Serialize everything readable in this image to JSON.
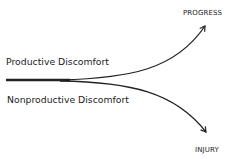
{
  "diagram": {
    "outcome_top": "PROGRESS",
    "outcome_bottom": "INJURY",
    "branch_top": "Productive Discomfort",
    "branch_bottom": "Nonproductive Discomfort",
    "line_color": "#222222"
  }
}
